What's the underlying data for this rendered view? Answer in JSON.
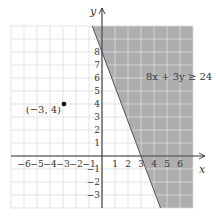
{
  "chart_data": {
    "type": "scatter",
    "title": "",
    "xlabel": "x",
    "ylabel": "y",
    "xlim": [
      -7,
      7
    ],
    "ylim": [
      -4,
      10
    ],
    "grid": true,
    "x_ticks": [
      -6,
      -5,
      -4,
      -3,
      -2,
      -1,
      1,
      2,
      3,
      4,
      5,
      6
    ],
    "y_ticks": [
      -3,
      -2,
      -1,
      1,
      2,
      3,
      4,
      5,
      6,
      7,
      8
    ],
    "inequality": {
      "label": "8x + 3y ≥ 24",
      "boundary": {
        "a": 8,
        "b": 3,
        "c": 24,
        "solid": true
      },
      "shaded_side": "right",
      "shade_color": "#aeaeae"
    },
    "points": [
      {
        "x": -3,
        "y": 4,
        "label": "(−3, 4)"
      }
    ]
  },
  "colors": {
    "grid": "#dcdcdc",
    "axis": "#333333",
    "shade": "#aeaeae",
    "boundary": "#555555",
    "point": "#000000"
  }
}
